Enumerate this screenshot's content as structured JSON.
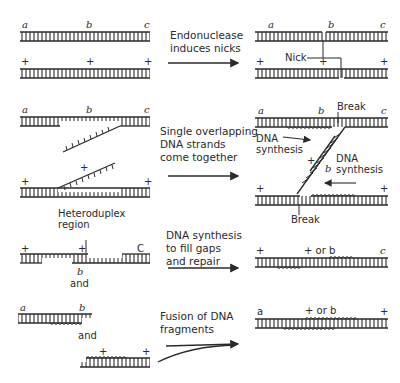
{
  "diagram": {
    "title": "",
    "steps": [
      {
        "id": "step1",
        "caption": [
          "Endonuclease",
          "induces nicks"
        ],
        "left_labels": {
          "top": [
            "a",
            "b",
            "c"
          ],
          "bottom": [
            "+",
            "+",
            "+"
          ]
        },
        "right_labels": {
          "top": [
            "a",
            "b",
            "c"
          ],
          "bottom": [
            "+",
            "+",
            "+"
          ],
          "callout": "Nick"
        }
      },
      {
        "id": "step2",
        "caption": [
          "Single overlapping",
          "DNA strands",
          "come together"
        ],
        "left_labels": {
          "top": [
            "a",
            "b",
            "c"
          ],
          "bottom": [
            "+",
            "+",
            "+"
          ]
        },
        "right_labels": {
          "top": [
            "a",
            "b",
            "c"
          ],
          "bottom": [
            "+",
            "+"
          ],
          "mid": [
            "+",
            "b"
          ],
          "break_top": "Break",
          "break_bottom": "Break",
          "synth_left": [
            "DNA",
            "synthesis"
          ],
          "synth_right": [
            "DNA",
            "synthesis"
          ]
        }
      },
      {
        "id": "step3",
        "caption": [
          "DNA synthesis",
          "to fill gaps",
          "and repair"
        ],
        "left_labels": {
          "region": [
            "Heteroduplex",
            "region"
          ],
          "top": [
            "+",
            "+",
            "C"
          ],
          "below": "b",
          "and": "and"
        },
        "right_labels": {
          "top": [
            "+",
            "+ or b",
            "c"
          ]
        }
      },
      {
        "id": "step4",
        "caption": [
          "Fusion of DNA",
          "fragments"
        ],
        "left_labels": {
          "top": [
            "a",
            "b"
          ],
          "and": "and",
          "bottom": [
            "+",
            "+"
          ]
        },
        "right_labels": {
          "top": [
            "a",
            "+ or b",
            "+"
          ]
        }
      }
    ],
    "colors": {
      "ink": "#2a2a2a",
      "background": "#ffffff"
    }
  }
}
